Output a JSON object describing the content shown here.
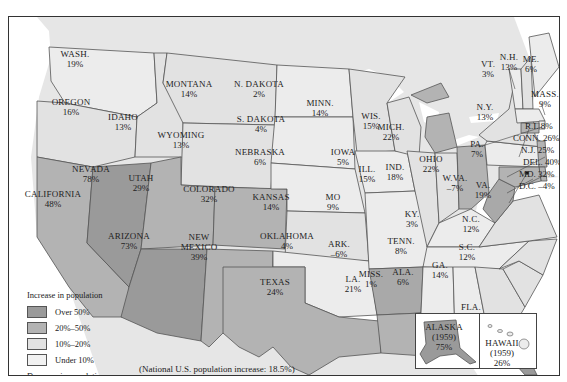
{
  "colors": {
    "over50": "#9a9a9a",
    "p20to50": "#b3b3b3",
    "p10to20": "#e2e2e2",
    "under10": "#ececec",
    "decrease": "#a9a9a9",
    "background_land": "#e6e6e6",
    "water": "#ffffff"
  },
  "legend": {
    "increase_header": "Increase in population",
    "items": [
      {
        "label": "Over 50%",
        "key": "over50"
      },
      {
        "label": "20%–50%",
        "key": "p20to50"
      },
      {
        "label": "10%–20%",
        "key": "p10to20"
      },
      {
        "label": "Under 10%",
        "key": "under10"
      }
    ],
    "decrease_header": "Decrease in population",
    "decrease_items": [
      {
        "label": "Under 10%",
        "key": "decrease"
      }
    ]
  },
  "national_note": "(National U.S. population increase: 18.5%)",
  "states": {
    "wash": {
      "name": "WASH.",
      "value": "19%"
    },
    "oregon": {
      "name": "OREGON",
      "value": "16%"
    },
    "california": {
      "name": "CALIFORNIA",
      "value": "48%"
    },
    "nevada": {
      "name": "NEVADA",
      "value": "78%"
    },
    "idaho": {
      "name": "IDAHO",
      "value": "13%"
    },
    "montana": {
      "name": "MONTANA",
      "value": "14%"
    },
    "wyoming": {
      "name": "WYOMING",
      "value": "13%"
    },
    "utah": {
      "name": "UTAH",
      "value": "29%"
    },
    "colorado": {
      "name": "COLORADO",
      "value": "32%"
    },
    "arizona": {
      "name": "ARIZONA",
      "value": "73%"
    },
    "new_mexico": {
      "name_line1": "NEW",
      "name_line2": "MEXICO",
      "value": "39%"
    },
    "n_dakota": {
      "name": "N. DAKOTA",
      "value": "2%"
    },
    "s_dakota": {
      "name": "S. DAKOTA",
      "value": "4%"
    },
    "nebraska": {
      "name": "NEBRASKA",
      "value": "6%"
    },
    "kansas": {
      "name": "KANSAS",
      "value": "14%"
    },
    "oklahoma": {
      "name": "OKLAHOMA",
      "value": "4%"
    },
    "texas": {
      "name": "TEXAS",
      "value": "24%"
    },
    "minn": {
      "name": "MINN.",
      "value": "14%"
    },
    "iowa": {
      "name": "IOWA",
      "value": "5%"
    },
    "mo": {
      "name": "MO",
      "value": "9%"
    },
    "ark": {
      "name": "ARK.",
      "value": "–6%"
    },
    "la": {
      "name": "LA.",
      "value": "21%"
    },
    "wis": {
      "name": "WIS.",
      "value": "15%"
    },
    "ill": {
      "name": "ILL.",
      "value": "15%"
    },
    "mich": {
      "name": "MICH.",
      "value": "22%"
    },
    "ind": {
      "name": "IND.",
      "value": "18%"
    },
    "ohio": {
      "name": "OHIO",
      "value": "22%"
    },
    "ky": {
      "name": "KY.",
      "value": "3%"
    },
    "tenn": {
      "name": "TENN.",
      "value": "8%"
    },
    "miss": {
      "name": "MISS.",
      "value": "1%"
    },
    "ala": {
      "name": "ALA.",
      "value": "6%"
    },
    "ga": {
      "name": "GA.",
      "value": "14%"
    },
    "fla": {
      "name": "FLA.",
      "value": "78%"
    },
    "sc": {
      "name": "S.C.",
      "value": "12%"
    },
    "nc": {
      "name": "N.C.",
      "value": "12%"
    },
    "va": {
      "name": "VA.",
      "value": "19%"
    },
    "wva": {
      "name": "W.VA.",
      "value": "–7%"
    },
    "pa": {
      "name": "PA.",
      "value": "7%"
    },
    "ny": {
      "name": "N.Y.",
      "value": "13%"
    },
    "vt": {
      "name": "VT.",
      "value": "3%"
    },
    "nh": {
      "name": "N.H.",
      "value": "13%"
    },
    "me": {
      "name": "ME.",
      "value": "6%"
    },
    "mass": {
      "name": "MASS.",
      "value": "9%"
    },
    "ri": {
      "label": "R.I. 8%"
    },
    "conn": {
      "label": "CONN. 26%"
    },
    "nj": {
      "label": "N.J. 25%"
    },
    "del": {
      "label": "DEL. 40%"
    },
    "md": {
      "label": "MD. 32%"
    },
    "dc": {
      "label": "D.C. –4%"
    },
    "alaska": {
      "name": "ALASKA",
      "year": "(1959)",
      "value": "75%"
    },
    "hawaii": {
      "name": "HAWAII",
      "year": "(1959)",
      "value": "26%"
    }
  }
}
